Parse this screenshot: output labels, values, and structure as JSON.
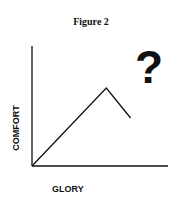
{
  "chart_data": {
    "type": "line",
    "title": "Figure 2",
    "xlabel": "GLORY",
    "ylabel": "COMFORT",
    "annotations": [
      "?"
    ],
    "grid": false,
    "legend": null,
    "ticks": false,
    "series": [
      {
        "name": "comfort-vs-glory",
        "points": [
          {
            "x": 0,
            "y": 0
          },
          {
            "x": 0.55,
            "y": 0.65
          },
          {
            "x": 0.73,
            "y": 0.4
          }
        ]
      }
    ],
    "xlim": [
      0,
      1
    ],
    "ylim": [
      0,
      1
    ]
  },
  "figure": {
    "title": "Figure 2",
    "xlabel": "GLORY",
    "ylabel": "COMFORT",
    "annotation": "?"
  }
}
